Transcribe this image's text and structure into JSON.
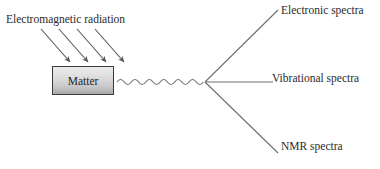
{
  "diagram": {
    "title_text": "Electromagnetic radiation interacting with matter producing spectra",
    "input_label": "Electromagnetic radiation",
    "matter_label": "Matter",
    "outputs": [
      {
        "label": "Electronic spectra"
      },
      {
        "label": "Vibrational spectra"
      },
      {
        "label": "NMR spectra"
      }
    ],
    "colors": {
      "background": "#ffffff",
      "stroke": "#6e6e6e",
      "arrow_stroke": "#555555",
      "text": "#2b2b2b",
      "box_border": "#3a3a3a",
      "box_fill_top": "#ececed",
      "box_fill_bottom": "#a9a9ac"
    },
    "icons": {
      "incoming_arrows": "arrow-down-right-icon",
      "wave": "sine-wave-icon",
      "fan": "fan-out-lines-icon"
    },
    "geometry": {
      "incoming_arrow_count": 4,
      "wave_cycles": 12,
      "fan_vertex": {
        "x": 205,
        "y": 82
      }
    }
  }
}
